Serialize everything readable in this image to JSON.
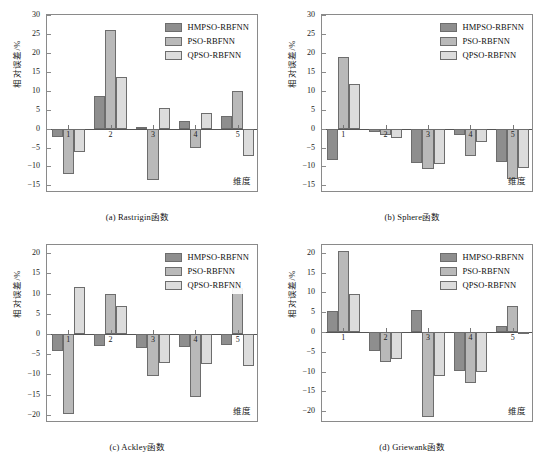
{
  "figure": {
    "series_names": [
      "HMPSO-RBFNN",
      "PSO-RBFNN",
      "QPSO-RBFNN"
    ],
    "series_colors": [
      "#8e8e8e",
      "#b9b9b9",
      "#dcdcdc"
    ],
    "ylabel": "相对误差/%",
    "xlabel": "维度",
    "captions": [
      "(a) Rastrigin函数",
      "(b) Sphere函数",
      "(c) Ackley函数",
      "(d) Griewank函数"
    ]
  },
  "chart_data": [
    {
      "type": "bar",
      "panel": "a",
      "title": "(a) Rastrigin函数",
      "categories": [
        "1",
        "2",
        "3",
        "4",
        "5"
      ],
      "series": [
        {
          "name": "HMPSO-RBFNN",
          "values": [
            -2.3,
            8.7,
            0.5,
            2.1,
            3.2
          ]
        },
        {
          "name": "PSO-RBFNN",
          "values": [
            -11.9,
            26.0,
            -13.7,
            -5.2,
            10.0
          ]
        },
        {
          "name": "QPSO-RBFNN",
          "values": [
            -6.2,
            13.6,
            5.5,
            4.1,
            -7.2
          ]
        }
      ],
      "xlabel": "维度",
      "ylabel": "相对误差/%",
      "ylim": [
        -17,
        30
      ],
      "yticks": [
        30,
        25,
        20,
        15,
        10,
        5,
        0,
        -5,
        -10,
        -15
      ],
      "grid": false,
      "legend_position": "top-right"
    },
    {
      "type": "bar",
      "panel": "b",
      "title": "(b) Sphere函数",
      "categories": [
        "1",
        "2",
        "3",
        "4",
        "5"
      ],
      "series": [
        {
          "name": "HMPSO-RBFNN",
          "values": [
            -8.2,
            -0.9,
            -9.0,
            -1.6,
            -8.7
          ]
        },
        {
          "name": "PSO-RBFNN",
          "values": [
            18.8,
            -1.7,
            -10.6,
            -7.2,
            -13.4
          ]
        },
        {
          "name": "QPSO-RBFNN",
          "values": [
            11.8,
            -2.4,
            -9.3,
            -3.5,
            -10.5
          ]
        }
      ],
      "xlabel": "维度",
      "ylabel": "相对误差/%",
      "ylim": [
        -17,
        30
      ],
      "yticks": [
        30,
        25,
        20,
        15,
        10,
        5,
        0,
        -5,
        -10,
        -15
      ],
      "grid": false,
      "legend_position": "top-right"
    },
    {
      "type": "bar",
      "panel": "c",
      "title": "(c) Ackley函数",
      "categories": [
        "1",
        "2",
        "3",
        "4",
        "5"
      ],
      "series": [
        {
          "name": "HMPSO-RBFNN",
          "values": [
            -4.2,
            -3.0,
            -3.4,
            -3.3,
            -2.8
          ]
        },
        {
          "name": "PSO-RBFNN",
          "values": [
            -19.8,
            10.0,
            -10.4,
            -15.6,
            11.3
          ]
        },
        {
          "name": "QPSO-RBFNN",
          "values": [
            11.5,
            6.8,
            -7.1,
            -7.4,
            -7.8
          ]
        }
      ],
      "xlabel": "维度",
      "ylabel": "相对误差/%",
      "ylim": [
        -22,
        22
      ],
      "yticks": [
        20,
        15,
        10,
        5,
        0,
        -5,
        -10,
        -15,
        -20
      ],
      "grid": false,
      "legend_position": "top-right"
    },
    {
      "type": "bar",
      "panel": "d",
      "title": "(d) Griewank函数",
      "categories": [
        "1",
        "2",
        "3",
        "4",
        "5"
      ],
      "series": [
        {
          "name": "HMPSO-RBFNN",
          "values": [
            5.3,
            -4.7,
            5.5,
            -9.8,
            1.5
          ]
        },
        {
          "name": "PSO-RBFNN",
          "values": [
            20.5,
            -7.5,
            -21.5,
            -12.9,
            6.7
          ]
        },
        {
          "name": "QPSO-RBFNN",
          "values": [
            9.5,
            -6.8,
            -11.2,
            -10.2,
            -0.5
          ]
        }
      ],
      "xlabel": "维度",
      "ylabel": "相对误差/%",
      "ylim": [
        -23,
        22
      ],
      "yticks": [
        20,
        15,
        10,
        5,
        0,
        -5,
        -10,
        -15,
        -20
      ],
      "grid": false,
      "legend_position": "top-right"
    }
  ]
}
